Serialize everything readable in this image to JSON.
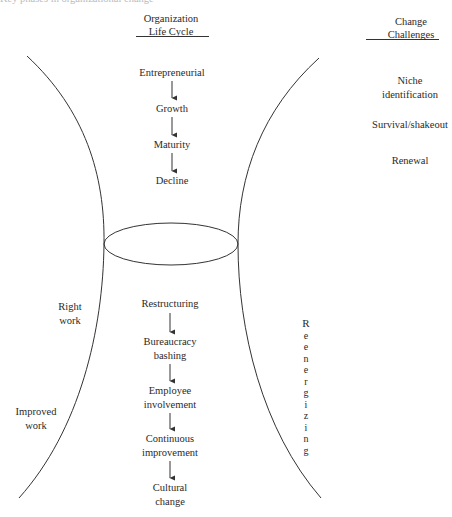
{
  "cut_top_text": "Key phases in organizational change",
  "headings": {
    "life_cycle": "Organization\nLife Cycle",
    "life_cycle_line1": "Organization",
    "life_cycle_line2": "Life Cycle",
    "challenges_line1": "Change",
    "challenges_line2": "Challenges"
  },
  "life_cycle_stages": [
    {
      "label": "Entrepreneurial"
    },
    {
      "label": "Growth"
    },
    {
      "label": "Maturity"
    },
    {
      "label": "Decline"
    }
  ],
  "change_challenges": [
    {
      "line1": "Niche",
      "line2": "identification"
    },
    {
      "line1": "Survival/shakeout",
      "line2": ""
    },
    {
      "line1": "Renewal",
      "line2": ""
    }
  ],
  "change_sequence": [
    {
      "line1": "Restructuring",
      "line2": ""
    },
    {
      "line1": "Bureaucracy",
      "line2": "bashing"
    },
    {
      "line1": "Employee",
      "line2": "involvement"
    },
    {
      "line1": "Continuous",
      "line2": "improvement"
    },
    {
      "line1": "Cultural",
      "line2": "change"
    }
  ],
  "left_labels": {
    "right_work_1": "Right",
    "right_work_2": "work",
    "improved_work_1": "Improved",
    "improved_work_2": "work"
  },
  "vertical_label": "Reenergizing",
  "colors": {
    "stroke": "#333333",
    "text": "#2a2a2a"
  }
}
